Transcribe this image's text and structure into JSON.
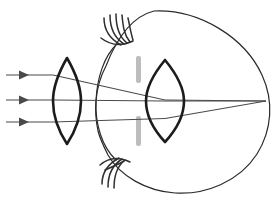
{
  "figure": {
    "title": "Eye refraction diagram with corrective lens",
    "type": "optics-ray-diagram",
    "canvas": {
      "width": 280,
      "height": 202,
      "background": "#ffffff"
    },
    "optical_axis_y": 101
  },
  "colors": {
    "outline": "#2b2b2b",
    "lens": "#1c1c1c",
    "ray": "#4a4a4a",
    "iris": "#bdbdbd",
    "lash": "#2e2e2e",
    "background": "#ffffff"
  },
  "parts": {
    "corrective_lens": {
      "name": "corrective-lens",
      "center_x": 67,
      "top_y": 58,
      "bottom_y": 144,
      "half_width": 14,
      "shape": "biconvex"
    },
    "eyeball": {
      "name": "eyeball",
      "center_x": 186,
      "center_y": 101,
      "radius_x": 82,
      "radius_y": 92,
      "cornea_apex_x": 98
    },
    "crystalline_lens": {
      "name": "crystalline-lens",
      "center_x": 165,
      "top_y": 60,
      "bottom_y": 142,
      "half_width": 19,
      "shape": "biconvex"
    },
    "iris_top": {
      "name": "iris-top",
      "x": 136,
      "y": 56,
      "width": 5,
      "height": 27
    },
    "iris_bottom": {
      "name": "iris-bottom",
      "x": 136,
      "y": 116,
      "width": 5,
      "height": 30
    },
    "focal_point": {
      "name": "focal-point-retina",
      "x": 266,
      "y": 101
    }
  },
  "rays": {
    "count": 3,
    "incoming_y": [
      75,
      100,
      122
    ],
    "arrow_start_x": 6,
    "arrow_head_x": 27,
    "label": "parallel-incident-light-rays",
    "converge_at": {
      "x": 266,
      "y": 101
    }
  },
  "eyelashes": {
    "top": {
      "name": "eyelashes-top",
      "count": 5,
      "origin": {
        "x": 120,
        "y": 45
      }
    },
    "bottom": {
      "name": "eyelashes-bottom",
      "count": 5,
      "origin": {
        "x": 118,
        "y": 157
      }
    }
  }
}
